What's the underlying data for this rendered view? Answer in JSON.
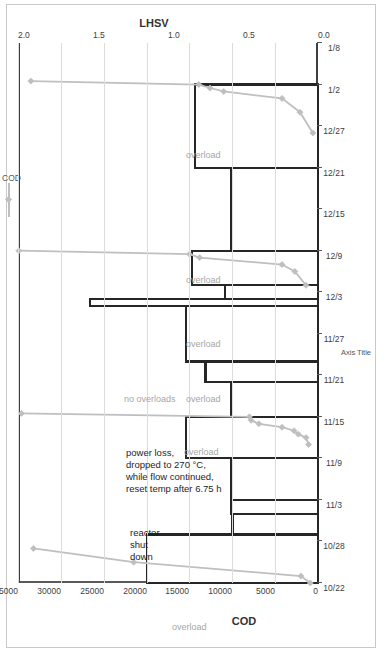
{
  "chart_data": {
    "type": "bar",
    "title": "",
    "xlabel": "Axis Title",
    "ylabel": "COD",
    "y2label": "LHSV",
    "ylim": [
      0,
      35000
    ],
    "y2lim": [
      0.0,
      2.0
    ],
    "grid": true,
    "legend_position": "top-right",
    "categories": [
      "10/22",
      "10/28",
      "11/3",
      "11/9",
      "11/15",
      "11/21",
      "11/27",
      "12/3",
      "12/9",
      "12/15",
      "12/21",
      "12/27",
      "1/2",
      "1/8"
    ],
    "x_ticklabels": [
      "10/22",
      "10/28",
      "11/3",
      "11/9",
      "11/15",
      "11/21",
      "11/27",
      "12/3",
      "12/9",
      "12/15",
      "12/21",
      "12/27",
      "1/2",
      "1/8"
    ],
    "y_ticklabels": [
      "0",
      "5000",
      "10000",
      "15000",
      "20000",
      "25000",
      "30000",
      "35000"
    ],
    "y_tickvalues": [
      0,
      5000,
      10000,
      15000,
      20000,
      25000,
      30000,
      35000
    ],
    "y2_ticklabels": [
      "0.0",
      "0.5",
      "1.0",
      "1.5",
      "2.0"
    ],
    "y2_tickvalues": [
      0.0,
      0.5,
      1.0,
      1.5,
      2.0
    ],
    "series": [
      {
        "name": "LHSV",
        "type": "step-bar",
        "axis": "y2",
        "color": "#262626",
        "fill": "#ffffff",
        "steps": [
          {
            "x0": "10/22",
            "x1": "10/29",
            "value": 1.14
          },
          {
            "x0": "10/29",
            "x1": "11/1",
            "value": 0.57
          },
          {
            "x0": "11/1",
            "x1": "11/3",
            "value": 0.58
          },
          {
            "x0": "11/3",
            "x1": "11/9",
            "value": 0.58
          },
          {
            "x0": "11/9",
            "x1": "11/15",
            "value": 0.88
          },
          {
            "x0": "11/15",
            "x1": "11/20",
            "value": 0.58
          },
          {
            "x0": "11/20",
            "x1": "11/23",
            "value": 0.75
          },
          {
            "x0": "11/23",
            "x1": "12/1",
            "value": 0.88
          },
          {
            "x0": "12/1",
            "x1": "12/2",
            "value": 1.52
          },
          {
            "x0": "12/2",
            "x1": "12/4",
            "value": 0.62
          },
          {
            "x0": "12/4",
            "x1": "12/9",
            "value": 0.84
          },
          {
            "x0": "12/9",
            "x1": "12/21",
            "value": 0.58
          },
          {
            "x0": "12/21",
            "x1": "1/2",
            "value": 0.82
          },
          {
            "x0": "1/2",
            "x1": "1/8",
            "value": 0.0
          }
        ]
      },
      {
        "name": "COD",
        "type": "line",
        "axis": "y",
        "color": "#bfbfbf",
        "marker": "diamond",
        "points": [
          {
            "x": "10/22",
            "y": 900
          },
          {
            "x": "10/23",
            "y": 2000
          },
          {
            "x": "10/25",
            "y": 21500
          },
          {
            "x": "10/27",
            "y": 33200
          },
          {
            "x": "11/11",
            "y": 1100
          },
          {
            "x": "11/12",
            "y": 1400
          },
          {
            "x": "11/12.5",
            "y": 2300
          },
          {
            "x": "11/13",
            "y": 2800
          },
          {
            "x": "11/13.5",
            "y": 4200
          },
          {
            "x": "11/14",
            "y": 6900
          },
          {
            "x": "11/14.5",
            "y": 7800
          },
          {
            "x": "11/15",
            "y": 8000
          },
          {
            "x": "11/15.5",
            "y": 34600
          },
          {
            "x": "12/4",
            "y": 1400
          },
          {
            "x": "12/6",
            "y": 2700
          },
          {
            "x": "12/7",
            "y": 4200
          },
          {
            "x": "12/8",
            "y": 13800
          },
          {
            "x": "12/8.5",
            "y": 15000
          },
          {
            "x": "12/9",
            "y": 34900
          },
          {
            "x": "12/26",
            "y": 600
          },
          {
            "x": "12/29",
            "y": 2100
          },
          {
            "x": "12/31",
            "y": 4200
          },
          {
            "x": "1/1",
            "y": 11000
          },
          {
            "x": "1/1.5",
            "y": 12600
          },
          {
            "x": "1/2",
            "y": 13900
          },
          {
            "x": "1/2.5",
            "y": 33500
          }
        ]
      }
    ],
    "annotations": [
      {
        "id": "overload-1",
        "text": "overload",
        "style": "gray",
        "x_px": 25,
        "y_px": 168
      },
      {
        "id": "reactor-shut-down",
        "text": "reactor\nshut\ndown",
        "style": "black",
        "x_px": 120,
        "y_px": 126
      },
      {
        "id": "power-loss-note",
        "text": "power loss,\ndropped to 270 °C,\nwhile flow continued,\nreset temp after 6.75 h",
        "style": "dark",
        "x_px": 200,
        "y_px": 122
      },
      {
        "id": "overload-2",
        "text": "overload",
        "style": "gray",
        "x_px": 200,
        "y_px": 180
      },
      {
        "id": "overload-3",
        "text": "overload",
        "style": "gray",
        "x_px": 253,
        "y_px": 182
      },
      {
        "id": "no-overloads",
        "text": "no overloads",
        "style": "gray",
        "x_px": 253,
        "y_px": 120
      },
      {
        "id": "overload-4",
        "text": "overload",
        "style": "gray",
        "x_px": 308,
        "y_px": 182
      },
      {
        "id": "overload-5",
        "text": "overload",
        "style": "gray",
        "x_px": 372,
        "y_px": 182
      },
      {
        "id": "overload-6",
        "text": "overload",
        "style": "gray",
        "x_px": 497,
        "y_px": 182
      }
    ],
    "legend": [
      {
        "label": "COD",
        "color": "#bfbfbf",
        "marker": "diamond"
      }
    ]
  }
}
